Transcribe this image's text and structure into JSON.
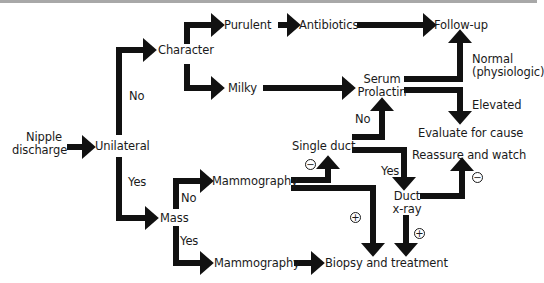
{
  "diagram": {
    "type": "flowchart",
    "nodes": {
      "start": "Nipple\ndischarge",
      "start_line1": "Nipple",
      "start_line2": "discharge",
      "unilateral": "Unilateral",
      "character": "Character",
      "purulent": "Purulent",
      "antibiotics": "Antibiotics",
      "follow_up": "Follow-up",
      "milky": "Milky",
      "serum_prolactin_line1": "Serum",
      "serum_prolactin_line2": "Prolactin",
      "normal_line1": "Normal",
      "normal_line2": "(physiologic)",
      "elevated": "Elevated",
      "evaluate": "Evaluate for cause",
      "single_duct": "Single duct",
      "reassure": "Reassure and watch",
      "duct_xray_line1": "Duct",
      "duct_xray_line2": "x-ray",
      "mass": "Mass",
      "mammography_no": "Mammography",
      "mammography_yes": "Mammography",
      "biopsy": "Biopsy and treatment"
    },
    "edge_labels": {
      "unilateral_no": "No",
      "unilateral_yes": "Yes",
      "mass_no": "No",
      "mass_yes": "Yes",
      "single_duct_no": "No",
      "single_duct_yes": "Yes",
      "negative": "−",
      "positive": "+"
    },
    "edges": [
      {
        "from": "Nipple discharge",
        "to": "Unilateral"
      },
      {
        "from": "Unilateral",
        "to": "Character",
        "label": "No"
      },
      {
        "from": "Unilateral",
        "to": "Mass",
        "label": "Yes"
      },
      {
        "from": "Character",
        "to": "Purulent"
      },
      {
        "from": "Character",
        "to": "Milky"
      },
      {
        "from": "Purulent",
        "to": "Antibiotics"
      },
      {
        "from": "Antibiotics",
        "to": "Follow-up"
      },
      {
        "from": "Milky",
        "to": "Serum Prolactin"
      },
      {
        "from": "Serum Prolactin",
        "to": "Follow-up",
        "label": "Normal (physiologic)"
      },
      {
        "from": "Serum Prolactin",
        "to": "Evaluate for cause",
        "label": "Elevated"
      },
      {
        "from": "Mass",
        "to": "Mammography",
        "label": "No"
      },
      {
        "from": "Mass",
        "to": "Mammography",
        "label": "Yes"
      },
      {
        "from": "Mammography",
        "to": "Single duct",
        "label": "−"
      },
      {
        "from": "Mammography",
        "to": "Biopsy and treatment",
        "label": "+"
      },
      {
        "from": "Single duct",
        "to": "Serum Prolactin",
        "label": "No"
      },
      {
        "from": "Single duct",
        "to": "Duct x-ray",
        "label": "Yes"
      },
      {
        "from": "Duct x-ray",
        "to": "Reassure and watch",
        "label": "−"
      },
      {
        "from": "Duct x-ray",
        "to": "Biopsy and treatment",
        "label": "+"
      },
      {
        "from": "Mammography",
        "to": "Biopsy and treatment"
      }
    ],
    "colors": {
      "arrow": "#111111",
      "text": "#1a1a1a",
      "top_rule": "#a8a8a8",
      "background": "#ffffff"
    }
  }
}
